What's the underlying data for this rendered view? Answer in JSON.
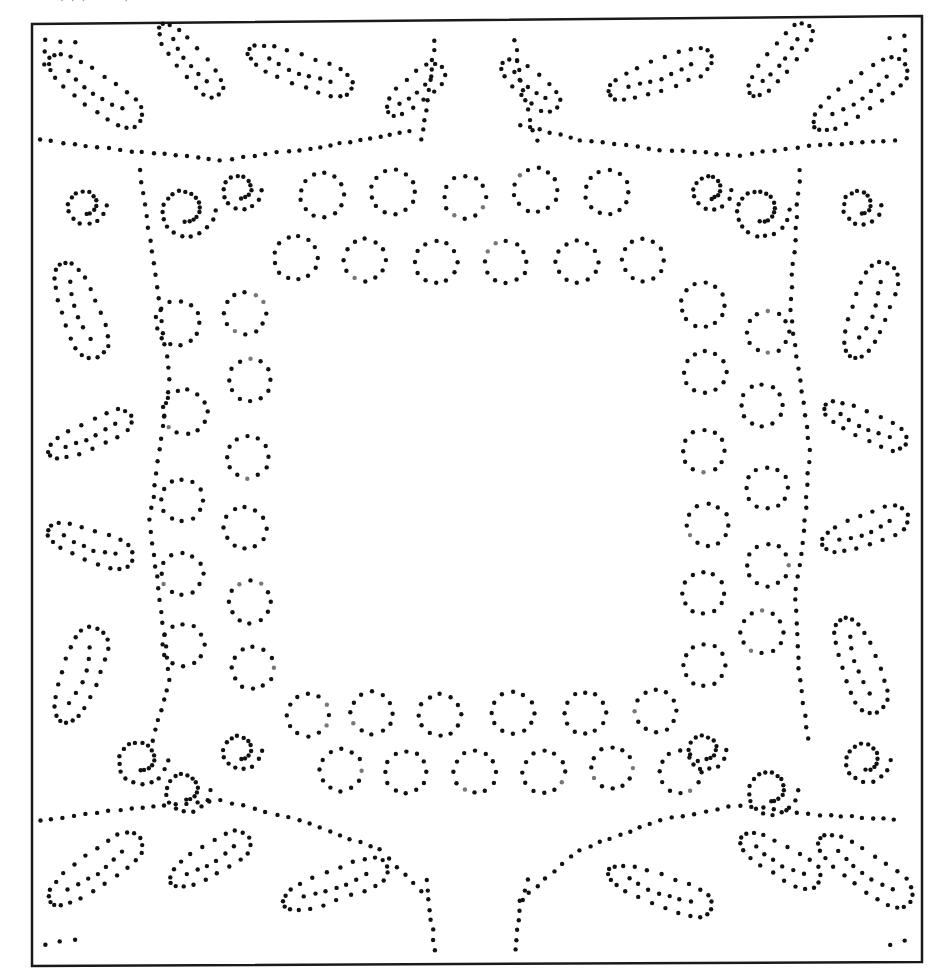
{
  "page": {
    "width": 941,
    "height": 978,
    "background": "#ffffff",
    "caption_fragment": "· · ·   ˙ ˙ ˙  ·  ˙"
  },
  "frame": {
    "stroke": "#1a1a1a",
    "stroke_width": 2.5,
    "corners": [
      [
        32,
        24
      ],
      [
        922,
        16
      ],
      [
        922,
        962
      ],
      [
        32,
        966
      ]
    ]
  },
  "dots": {
    "color": "#111111",
    "faint_color": "#777777",
    "radius": 2.2,
    "spacing": 11
  },
  "motifs": {
    "top_loops": {
      "upper": [
        [
          322,
          195,
          22
        ],
        [
          393,
          192,
          22
        ],
        [
          465,
          197,
          21
        ],
        [
          536,
          190,
          22
        ],
        [
          607,
          192,
          22
        ]
      ],
      "lower": [
        [
          296,
          258,
          22
        ],
        [
          365,
          260,
          21
        ],
        [
          436,
          262,
          21
        ],
        [
          506,
          262,
          21
        ],
        [
          577,
          262,
          21
        ],
        [
          643,
          260,
          21
        ]
      ]
    },
    "bottom_loops": {
      "upper": [
        [
          308,
          715,
          21
        ],
        [
          372,
          713,
          21
        ],
        [
          440,
          715,
          21
        ],
        [
          513,
          713,
          21
        ],
        [
          585,
          713,
          21
        ],
        [
          656,
          711,
          21
        ]
      ],
      "lower": [
        [
          341,
          770,
          21
        ],
        [
          406,
          772,
          21
        ],
        [
          475,
          772,
          21
        ],
        [
          544,
          772,
          21
        ],
        [
          612,
          768,
          21
        ],
        [
          680,
          772,
          21
        ]
      ]
    },
    "left_loops": {
      "outer": [
        [
          178,
          323,
          22
        ],
        [
          185,
          412,
          22
        ],
        [
          182,
          500,
          21
        ],
        [
          182,
          574,
          21
        ],
        [
          183,
          645,
          21
        ]
      ],
      "inner": [
        [
          245,
          313,
          21
        ],
        [
          250,
          380,
          21
        ],
        [
          248,
          457,
          21
        ],
        [
          245,
          528,
          21
        ],
        [
          250,
          602,
          21
        ],
        [
          253,
          668,
          21
        ]
      ]
    },
    "right_loops": {
      "outer": [
        [
          703,
          305,
          22
        ],
        [
          705,
          372,
          21
        ],
        [
          704,
          451,
          21
        ],
        [
          708,
          525,
          21
        ],
        [
          703,
          593,
          21
        ],
        [
          704,
          665,
          21
        ]
      ],
      "inner": [
        [
          768,
          332,
          21
        ],
        [
          762,
          405,
          21
        ],
        [
          767,
          488,
          21
        ],
        [
          768,
          565,
          21
        ],
        [
          762,
          632,
          21
        ]
      ]
    },
    "leaves": [
      {
        "cx": 95,
        "cy": 90,
        "rx": 55,
        "ry": 28,
        "rot": 35
      },
      {
        "cx": 190,
        "cy": 60,
        "rx": 45,
        "ry": 22,
        "rot": 50
      },
      {
        "cx": 300,
        "cy": 70,
        "rx": 55,
        "ry": 25,
        "rot": 20
      },
      {
        "cx": 415,
        "cy": 90,
        "rx": 35,
        "ry": 22,
        "rot": -40
      },
      {
        "cx": 530,
        "cy": 85,
        "rx": 35,
        "ry": 22,
        "rot": 40
      },
      {
        "cx": 660,
        "cy": 75,
        "rx": 55,
        "ry": 25,
        "rot": -20
      },
      {
        "cx": 780,
        "cy": 60,
        "rx": 45,
        "ry": 22,
        "rot": -50
      },
      {
        "cx": 860,
        "cy": 95,
        "rx": 55,
        "ry": 28,
        "rot": -35
      },
      {
        "cx": 80,
        "cy": 310,
        "rx": 50,
        "ry": 30,
        "rot": 70
      },
      {
        "cx": 90,
        "cy": 435,
        "rx": 45,
        "ry": 22,
        "rot": -25
      },
      {
        "cx": 90,
        "cy": 545,
        "rx": 45,
        "ry": 25,
        "rot": 20
      },
      {
        "cx": 80,
        "cy": 675,
        "rx": 50,
        "ry": 30,
        "rot": -70
      },
      {
        "cx": 870,
        "cy": 310,
        "rx": 50,
        "ry": 30,
        "rot": -70
      },
      {
        "cx": 865,
        "cy": 425,
        "rx": 45,
        "ry": 22,
        "rot": 25
      },
      {
        "cx": 865,
        "cy": 530,
        "rx": 45,
        "ry": 25,
        "rot": -20
      },
      {
        "cx": 860,
        "cy": 665,
        "rx": 50,
        "ry": 30,
        "rot": 70
      },
      {
        "cx": 95,
        "cy": 870,
        "rx": 55,
        "ry": 28,
        "rot": -35
      },
      {
        "cx": 210,
        "cy": 860,
        "rx": 45,
        "ry": 25,
        "rot": -30
      },
      {
        "cx": 335,
        "cy": 885,
        "rx": 55,
        "ry": 25,
        "rot": -20
      },
      {
        "cx": 660,
        "cy": 890,
        "rx": 55,
        "ry": 25,
        "rot": 20
      },
      {
        "cx": 780,
        "cy": 860,
        "rx": 45,
        "ry": 25,
        "rot": 30
      },
      {
        "cx": 865,
        "cy": 870,
        "rx": 55,
        "ry": 28,
        "rot": 35
      }
    ],
    "curls": [
      [
        85,
        205,
        22
      ],
      [
        185,
        210,
        30
      ],
      [
        140,
        760,
        28
      ],
      [
        185,
        790,
        25
      ],
      [
        760,
        210,
        30
      ],
      [
        860,
        205,
        22
      ],
      [
        770,
        790,
        28
      ],
      [
        865,
        760,
        25
      ],
      [
        240,
        750,
        22
      ],
      [
        705,
        750,
        22
      ],
      [
        240,
        190,
        22
      ],
      [
        710,
        190,
        22
      ]
    ],
    "vines": [
      [
        [
          40,
          140
        ],
        [
          120,
          150
        ],
        [
          220,
          160
        ],
        [
          300,
          150
        ],
        [
          360,
          140
        ],
        [
          420,
          130
        ]
      ],
      [
        [
          520,
          125
        ],
        [
          580,
          140
        ],
        [
          660,
          150
        ],
        [
          740,
          155
        ],
        [
          820,
          145
        ],
        [
          905,
          140
        ]
      ],
      [
        [
          40,
          820
        ],
        [
          120,
          810
        ],
        [
          220,
          800
        ],
        [
          300,
          820
        ],
        [
          380,
          850
        ],
        [
          430,
          900
        ]
      ],
      [
        [
          520,
          900
        ],
        [
          580,
          850
        ],
        [
          660,
          820
        ],
        [
          740,
          805
        ],
        [
          820,
          815
        ],
        [
          905,
          820
        ]
      ],
      [
        [
          140,
          170
        ],
        [
          150,
          240
        ],
        [
          160,
          310
        ],
        [
          170,
          380
        ],
        [
          160,
          450
        ],
        [
          150,
          520
        ],
        [
          160,
          600
        ],
        [
          170,
          680
        ],
        [
          150,
          750
        ]
      ],
      [
        [
          800,
          170
        ],
        [
          795,
          240
        ],
        [
          790,
          310
        ],
        [
          800,
          380
        ],
        [
          810,
          450
        ],
        [
          805,
          520
        ],
        [
          795,
          600
        ],
        [
          800,
          680
        ],
        [
          810,
          750
        ]
      ],
      [
        [
          435,
          40
        ],
        [
          430,
          80
        ],
        [
          425,
          120
        ],
        [
          420,
          150
        ]
      ],
      [
        [
          515,
          40
        ],
        [
          520,
          80
        ],
        [
          530,
          120
        ],
        [
          540,
          150
        ]
      ],
      [
        [
          435,
          950
        ],
        [
          430,
          910
        ],
        [
          425,
          870
        ]
      ],
      [
        [
          515,
          950
        ],
        [
          520,
          910
        ],
        [
          530,
          870
        ]
      ]
    ]
  }
}
